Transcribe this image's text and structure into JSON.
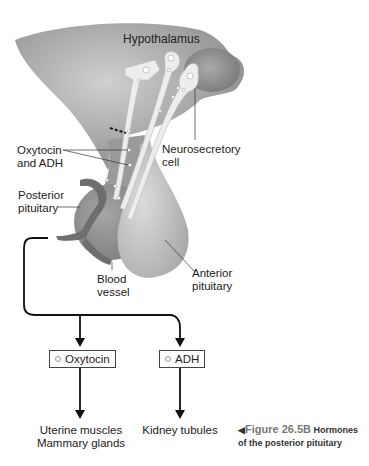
{
  "diagram": {
    "labels": {
      "hypothalamus": "Hypothalamus",
      "oxytocin_adh_line1": "Oxytocin",
      "oxytocin_adh_line2": "and ADH",
      "neurosecretory_line1": "Neurosecretory",
      "neurosecretory_line2": "cell",
      "posterior_line1": "Posterior",
      "posterior_line2": "pituitary",
      "blood_line1": "Blood",
      "blood_line2": "vessel",
      "anterior_line1": "Anterior",
      "anterior_line2": "pituitary"
    },
    "hormones": [
      {
        "name": "Oxytocin",
        "targets": [
          "Uterine muscles",
          "Mammary glands"
        ]
      },
      {
        "name": "ADH",
        "targets": [
          "Kidney tubules"
        ]
      }
    ],
    "caption": {
      "figure": "Figure 26.5B",
      "title_line1": "Hormones",
      "title_line2": "of the posterior pituitary"
    },
    "colors": {
      "tissue_dark": "#8f8f8f",
      "tissue_light": "#c9c9c9",
      "neuron": "#ececec",
      "line": "#111111"
    }
  }
}
